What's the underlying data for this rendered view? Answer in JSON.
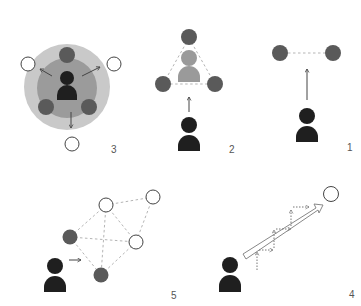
{
  "colors": {
    "background": "#ffffff",
    "outer_ring": "#c9c9c9",
    "inner_ring": "#9b9b9b",
    "person_dark": "#1f1f1f",
    "person_light": "#9a9a9a",
    "node_dark": "#5a5a5a",
    "node_white_fill": "#ffffff",
    "node_white_stroke": "#444444",
    "dashed_line": "#b5b5b5",
    "arrow": "#444444"
  },
  "panels": [
    {
      "id": "panel-1",
      "label": "1",
      "description": "person moving toward a pair of connected nodes"
    },
    {
      "id": "panel-2",
      "label": "2",
      "description": "person moving toward a triangle of nodes containing another person"
    },
    {
      "id": "panel-3",
      "label": "3",
      "description": "person in center of concentric rings pushing outward to white nodes"
    },
    {
      "id": "panel-4",
      "label": "4",
      "description": "person with stepwise dotted path along hollow arrow toward white node"
    },
    {
      "id": "panel-5",
      "label": "5",
      "description": "person approaching network of dark and white nodes with dashed connections"
    }
  ]
}
